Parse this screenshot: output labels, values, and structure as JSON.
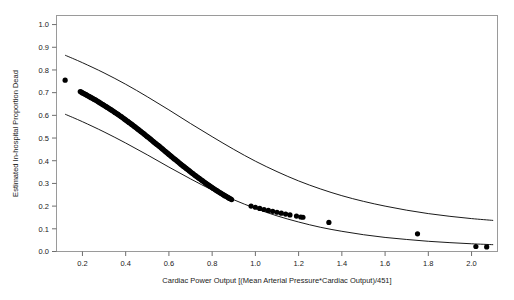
{
  "chart_data": {
    "type": "scatter",
    "title": "",
    "xlabel": "Cardiac Power Output [(Mean Arterial Pressure*Cardiac Output)/451]",
    "ylabel": "Estimated In-hospital Proportion Dead",
    "xlim": [
      0.08,
      2.12
    ],
    "ylim": [
      0.0,
      1.04
    ],
    "xticks": [
      0.2,
      0.4,
      0.6,
      0.8,
      1.0,
      1.2,
      1.4,
      1.6,
      1.8,
      2.0
    ],
    "xticklabels": [
      "0.2",
      "0.4",
      "0.6",
      "0.8",
      "1.0",
      "1.2",
      "1.4",
      "1.6",
      "1.8",
      "2.0"
    ],
    "yticks": [
      0.0,
      0.1,
      0.2,
      0.3,
      0.4,
      0.5,
      0.6,
      0.7,
      0.8,
      0.9,
      1.0
    ],
    "yticklabels": [
      "0.0",
      "0.1",
      "0.2",
      "0.3",
      "0.4",
      "0.5",
      "0.6",
      "0.7",
      "0.8",
      "0.9",
      "1.0"
    ],
    "grid": false,
    "legend": null,
    "frame": true,
    "point_color": "#000000",
    "line_color": "#000000",
    "series": [
      {
        "name": "Fitted probability (points)",
        "marker": "filled-circle",
        "x": [
          0.12,
          0.19,
          0.195,
          0.2,
          0.205,
          0.21,
          0.215,
          0.22,
          0.225,
          0.23,
          0.235,
          0.24,
          0.245,
          0.25,
          0.255,
          0.26,
          0.265,
          0.27,
          0.275,
          0.28,
          0.285,
          0.29,
          0.295,
          0.3,
          0.305,
          0.31,
          0.315,
          0.32,
          0.325,
          0.33,
          0.335,
          0.34,
          0.345,
          0.35,
          0.355,
          0.36,
          0.365,
          0.37,
          0.375,
          0.38,
          0.385,
          0.39,
          0.395,
          0.4,
          0.405,
          0.41,
          0.415,
          0.42,
          0.425,
          0.43,
          0.435,
          0.44,
          0.445,
          0.45,
          0.455,
          0.46,
          0.465,
          0.47,
          0.475,
          0.48,
          0.485,
          0.49,
          0.495,
          0.5,
          0.505,
          0.51,
          0.515,
          0.52,
          0.525,
          0.53,
          0.535,
          0.54,
          0.545,
          0.55,
          0.555,
          0.56,
          0.565,
          0.57,
          0.575,
          0.58,
          0.585,
          0.59,
          0.595,
          0.6,
          0.605,
          0.61,
          0.615,
          0.62,
          0.625,
          0.63,
          0.635,
          0.64,
          0.645,
          0.65,
          0.655,
          0.66,
          0.665,
          0.67,
          0.675,
          0.68,
          0.685,
          0.69,
          0.695,
          0.7,
          0.705,
          0.71,
          0.715,
          0.72,
          0.725,
          0.73,
          0.735,
          0.74,
          0.745,
          0.75,
          0.755,
          0.76,
          0.765,
          0.77,
          0.775,
          0.78,
          0.785,
          0.79,
          0.795,
          0.8,
          0.805,
          0.81,
          0.815,
          0.82,
          0.825,
          0.83,
          0.835,
          0.84,
          0.845,
          0.85,
          0.855,
          0.86,
          0.865,
          0.87,
          0.875,
          0.88,
          0.885,
          0.89,
          0.98,
          1.0,
          1.02,
          1.04,
          1.06,
          1.08,
          1.1,
          1.12,
          1.14,
          1.16,
          1.19,
          1.21,
          1.22,
          1.34,
          1.75,
          2.02,
          2.07
        ],
        "y": [
          0.755,
          0.705,
          0.702,
          0.699,
          0.697,
          0.694,
          0.692,
          0.689,
          0.686,
          0.684,
          0.681,
          0.678,
          0.676,
          0.673,
          0.67,
          0.668,
          0.665,
          0.662,
          0.659,
          0.656,
          0.653,
          0.65,
          0.647,
          0.644,
          0.641,
          0.638,
          0.635,
          0.632,
          0.629,
          0.626,
          0.623,
          0.62,
          0.617,
          0.613,
          0.61,
          0.607,
          0.604,
          0.6,
          0.597,
          0.594,
          0.59,
          0.587,
          0.583,
          0.58,
          0.576,
          0.573,
          0.569,
          0.566,
          0.562,
          0.559,
          0.555,
          0.551,
          0.548,
          0.544,
          0.54,
          0.537,
          0.533,
          0.529,
          0.525,
          0.522,
          0.518,
          0.514,
          0.51,
          0.506,
          0.503,
          0.499,
          0.495,
          0.491,
          0.487,
          0.483,
          0.479,
          0.475,
          0.471,
          0.468,
          0.464,
          0.46,
          0.456,
          0.452,
          0.448,
          0.444,
          0.44,
          0.436,
          0.432,
          0.428,
          0.424,
          0.42,
          0.416,
          0.412,
          0.408,
          0.405,
          0.401,
          0.397,
          0.393,
          0.389,
          0.385,
          0.381,
          0.377,
          0.374,
          0.37,
          0.366,
          0.362,
          0.359,
          0.355,
          0.351,
          0.347,
          0.344,
          0.34,
          0.336,
          0.333,
          0.329,
          0.326,
          0.322,
          0.319,
          0.315,
          0.312,
          0.308,
          0.305,
          0.301,
          0.298,
          0.295,
          0.291,
          0.288,
          0.285,
          0.282,
          0.278,
          0.275,
          0.272,
          0.269,
          0.266,
          0.263,
          0.26,
          0.257,
          0.254,
          0.251,
          0.248,
          0.245,
          0.243,
          0.24,
          0.237,
          0.234,
          0.232,
          0.229,
          0.2,
          0.195,
          0.19,
          0.185,
          0.181,
          0.177,
          0.173,
          0.169,
          0.165,
          0.161,
          0.156,
          0.152,
          0.151,
          0.128,
          0.078,
          0.022,
          0.02
        ]
      },
      {
        "name": "Upper confidence band",
        "marker": "line",
        "x": [
          0.12,
          0.2,
          0.3,
          0.4,
          0.5,
          0.6,
          0.7,
          0.8,
          0.9,
          1.0,
          1.1,
          1.2,
          1.3,
          1.4,
          1.5,
          1.6,
          1.7,
          1.8,
          1.9,
          2.0,
          2.1
        ],
        "y": [
          0.865,
          0.832,
          0.787,
          0.737,
          0.682,
          0.624,
          0.564,
          0.506,
          0.45,
          0.398,
          0.352,
          0.311,
          0.276,
          0.246,
          0.221,
          0.2,
          0.182,
          0.167,
          0.155,
          0.145,
          0.137
        ]
      },
      {
        "name": "Lower confidence band",
        "marker": "line",
        "x": [
          0.12,
          0.2,
          0.3,
          0.4,
          0.5,
          0.6,
          0.7,
          0.8,
          0.9,
          1.0,
          1.1,
          1.2,
          1.3,
          1.4,
          1.5,
          1.6,
          1.7,
          1.8,
          1.9,
          2.0,
          2.1
        ],
        "y": [
          0.605,
          0.572,
          0.527,
          0.478,
          0.426,
          0.372,
          0.32,
          0.271,
          0.228,
          0.19,
          0.157,
          0.13,
          0.107,
          0.089,
          0.074,
          0.062,
          0.053,
          0.045,
          0.039,
          0.034,
          0.03
        ]
      }
    ]
  }
}
